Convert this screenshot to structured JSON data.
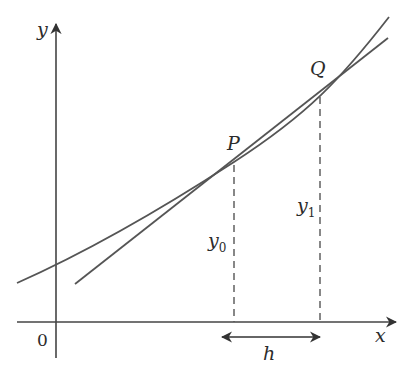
{
  "diagram": {
    "axes": {
      "x_label": "x",
      "y_label": "y",
      "origin_label": "0"
    },
    "points": {
      "P": "P",
      "Q": "Q"
    },
    "ordinates": {
      "y0_base": "y",
      "y0_sub": "0",
      "y1_base": "y",
      "y1_sub": "1"
    },
    "interval_label": "h",
    "colors": {
      "stroke": "#555555",
      "axis": "#444444",
      "text": "#2b2b2b",
      "background": "#ffffff"
    }
  }
}
